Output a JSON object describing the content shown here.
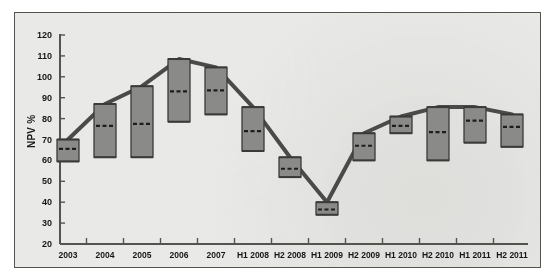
{
  "chart_data": {
    "type": "bar",
    "title": "",
    "subtitle": "",
    "xlabel": "",
    "ylabel": "NPV %",
    "ylim": [
      20,
      120
    ],
    "ytick_step": 10,
    "yticks": [
      20,
      30,
      40,
      50,
      60,
      70,
      80,
      90,
      100,
      110,
      120
    ],
    "grid": false,
    "legend": "none",
    "note": "Floating range (high-low) bars with a dashed mid/median marker; a connecting line traces the bar tops (range maxima).",
    "categories": [
      "2003",
      "2004",
      "2005",
      "2006",
      "2007",
      "H1 2008",
      "H2 2008",
      "H1 2009",
      "H2 2009",
      "H1 2010",
      "H2 2010",
      "H1 2011",
      "H2 2011"
    ],
    "series": [
      {
        "name": "High",
        "values": [
          70,
          87,
          95.5,
          108.5,
          104.5,
          85.5,
          61.5,
          40,
          73,
          81,
          85.5,
          85.5,
          82
        ]
      },
      {
        "name": "Low",
        "values": [
          59.5,
          61.5,
          61.5,
          78.5,
          82,
          64.5,
          52,
          34,
          60,
          73,
          60,
          68.5,
          66.5
        ]
      },
      {
        "name": "Mid",
        "values": [
          65.5,
          76.5,
          77.5,
          93,
          93.5,
          74,
          56,
          36.5,
          67,
          76.5,
          73.5,
          79,
          76
        ]
      }
    ],
    "line_series": {
      "name": "Trend (bar tops)",
      "values": [
        70,
        87,
        95.5,
        108.5,
        104.5,
        85.5,
        61.5,
        40,
        73,
        81,
        85.5,
        85.5,
        82
      ]
    },
    "colors": {
      "bar_fill": "#8a8a88",
      "bar_edge": "#3a3a38",
      "line": "#4a4a48",
      "mid_dash": "#1e1e1e",
      "axis": "#55534f",
      "panel_bg": "#e9e9e7",
      "text": "#161616"
    }
  }
}
